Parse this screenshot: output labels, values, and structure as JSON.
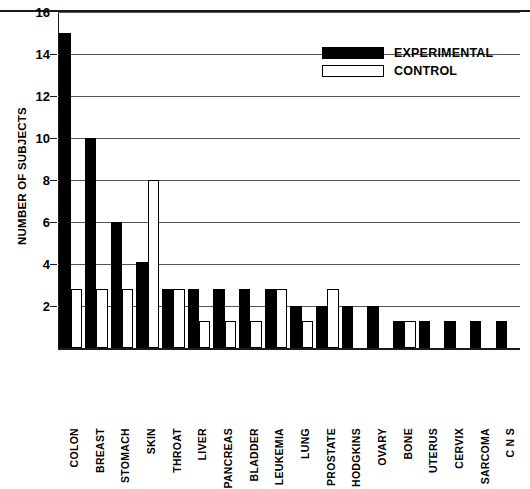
{
  "chart_data": {
    "type": "bar",
    "title": "",
    "xlabel": "",
    "ylabel": "NUMBER OF SUBJECTS",
    "ylim": [
      0,
      16
    ],
    "yticks": [
      2,
      4,
      6,
      8,
      10,
      12,
      14,
      16
    ],
    "grid": true,
    "legend_position": "top-right",
    "categories": [
      "COLON",
      "BREAST",
      "STOMACH",
      "SKIN",
      "THROAT",
      "LIVER",
      "PANCREAS",
      "BLADDER",
      "LEUKEMIA",
      "LUNG",
      "PROSTATE",
      "HODGKINS",
      "OVARY",
      "BONE",
      "UTERUS",
      "CERVIX",
      "SARCOMA",
      "C N S"
    ],
    "series": [
      {
        "name": "EXPERIMENTAL",
        "color": "#000000",
        "values": [
          15,
          10,
          6,
          4.1,
          2.8,
          2.8,
          2.8,
          2.8,
          2.8,
          2,
          2,
          2,
          2,
          1.3,
          1.3,
          1.3,
          1.3,
          1.3
        ]
      },
      {
        "name": "CONTROL",
        "color": "#ffffff",
        "values": [
          2.8,
          2.8,
          2.8,
          8,
          2.8,
          1.3,
          1.3,
          1.3,
          2.8,
          1.3,
          2.8,
          0,
          0,
          1.3,
          0,
          0,
          0,
          0
        ]
      }
    ]
  },
  "legend": {
    "entries": [
      {
        "label": "EXPERIMENTAL",
        "swatch": "filled-black"
      },
      {
        "label": "CONTROL",
        "swatch": "outlined-white"
      }
    ]
  },
  "axis": {
    "y_title": "NUMBER OF SUBJECTS",
    "tick_labels": [
      "16",
      "14",
      "12",
      "10",
      "8",
      "6",
      "4",
      "2"
    ]
  }
}
